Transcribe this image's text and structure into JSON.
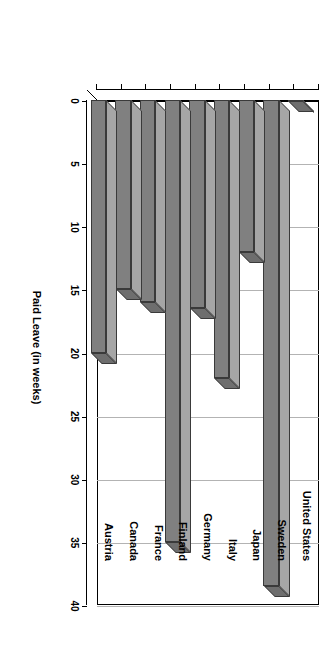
{
  "chart_data": {
    "type": "bar",
    "title": "",
    "xlabel": "",
    "ylabel": "Paid Leave (in weeks)",
    "ylim": [
      0,
      40
    ],
    "grid": true,
    "legend": "none",
    "orientation": "vertical-rotated-90",
    "categories": [
      "United States",
      "Sweden",
      "Japan",
      "Italy",
      "Germany",
      "Finland",
      "France",
      "Canada",
      "Austria"
    ],
    "values": [
      0,
      38.5,
      12,
      22,
      16.5,
      35,
      16,
      15,
      20
    ],
    "tick_labels": [
      "0",
      "5",
      "10",
      "15",
      "20",
      "25",
      "30",
      "35",
      "40"
    ],
    "tick_values": [
      0,
      5,
      10,
      15,
      20,
      25,
      30,
      35,
      40
    ]
  },
  "style": {
    "bar_face_color": "#808080",
    "bar_top_color": "#a6a6a6",
    "bar_side_color": "#6e6e6e",
    "bar_edge_color": "#3a3a3a",
    "grid_color": "#b3b3b3",
    "axis_color": "#000000",
    "background": "#ffffff"
  }
}
